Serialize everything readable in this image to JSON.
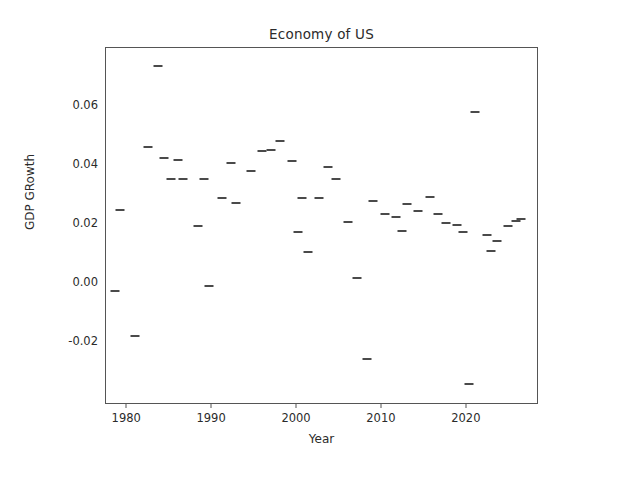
{
  "chart_data": {
    "type": "scatter",
    "title": "Economy of US",
    "xlabel": "Year",
    "ylabel": "GDP GRowth",
    "grid": false,
    "legend": null,
    "marker_style": "horizontal-dash",
    "marker_color": "#4a4a4a",
    "xlim": [
      1977.5,
      2028.5
    ],
    "ylim": [
      -0.0415,
      0.0795
    ],
    "xticks": [
      1980,
      1990,
      2000,
      2010,
      2020
    ],
    "xtick_labels": [
      "1980",
      "1990",
      "2000",
      "2010",
      "2020"
    ],
    "yticks": [
      0.06,
      0.04,
      0.02,
      0.0,
      -0.02
    ],
    "ytick_labels": [
      "0.06",
      "0.04",
      "0.02",
      "0.00",
      "-0.02"
    ],
    "x": [
      1979,
      1980,
      1981,
      1982,
      1983,
      1984,
      1985,
      1986,
      1987,
      1988,
      1989,
      1990,
      1991,
      1992,
      1993,
      1994,
      1995,
      1996,
      1997,
      1998,
      1999,
      2000,
      2001,
      2002,
      2003,
      2004,
      2005,
      2006,
      2007,
      2008,
      2009,
      2010,
      2011,
      2012,
      2013,
      2014,
      2015,
      2016,
      2017,
      2018,
      2019,
      2020,
      2021,
      2022,
      2023,
      2024,
      2025,
      2026
    ],
    "values": [
      0.0245,
      -0.003,
      -0.018,
      0.0733,
      0.0459,
      0.0421,
      0.0417,
      0.0352,
      0.0351,
      0.0192,
      -0.001,
      0.0352,
      0.0285,
      0.0405,
      0.0269,
      0.0379,
      0.0446,
      0.0448,
      0.0481,
      0.0412,
      0.0285,
      0.0173,
      0.0102,
      0.0285,
      0.039,
      0.0352,
      0.0206,
      0.0015,
      -0.0259,
      0.0276,
      0.0234,
      0.0223,
      0.0267,
      0.0175,
      0.0244,
      0.0291,
      0.0234,
      0.0578,
      -0.0345,
      0.0162,
      0.0108,
      0.0141,
      0.0192,
      0.0209,
      0.0201,
      0.0194,
      0.0173,
      0.0215
    ],
    "points": [
      {
        "year": 1979.2,
        "value": 0.0245
      },
      {
        "year": 1978.6,
        "value": -0.003
      },
      {
        "year": 1980.9,
        "value": -0.018
      },
      {
        "year": 1983.6,
        "value": 0.0733
      },
      {
        "year": 1982.4,
        "value": 0.0459
      },
      {
        "year": 1984.3,
        "value": 0.0421
      },
      {
        "year": 1986.0,
        "value": 0.0417
      },
      {
        "year": 1985.1,
        "value": 0.0352
      },
      {
        "year": 1986.6,
        "value": 0.0351
      },
      {
        "year": 1988.3,
        "value": 0.0192
      },
      {
        "year": 1989.6,
        "value": -0.001
      },
      {
        "year": 1989.1,
        "value": 0.0352
      },
      {
        "year": 1991.2,
        "value": 0.0285
      },
      {
        "year": 1992.2,
        "value": 0.0405
      },
      {
        "year": 1992.8,
        "value": 0.0269
      },
      {
        "year": 1994.6,
        "value": 0.0379
      },
      {
        "year": 1995.9,
        "value": 0.0446
      },
      {
        "year": 1996.9,
        "value": 0.0448
      },
      {
        "year": 1998.0,
        "value": 0.0481
      },
      {
        "year": 1999.4,
        "value": 0.0412
      },
      {
        "year": 2000.6,
        "value": 0.0285
      },
      {
        "year": 2000.1,
        "value": 0.0173
      },
      {
        "year": 2001.3,
        "value": 0.0102
      },
      {
        "year": 2002.6,
        "value": 0.0285
      },
      {
        "year": 2003.6,
        "value": 0.039
      },
      {
        "year": 2004.6,
        "value": 0.0352
      },
      {
        "year": 2006.0,
        "value": 0.0206
      },
      {
        "year": 2007.1,
        "value": 0.0015
      },
      {
        "year": 2008.3,
        "value": -0.0259
      },
      {
        "year": 2008.9,
        "value": 0.0276
      },
      {
        "year": 2010.4,
        "value": 0.0234
      },
      {
        "year": 2011.6,
        "value": 0.0223
      },
      {
        "year": 2013.0,
        "value": 0.0267
      },
      {
        "year": 2012.4,
        "value": 0.0175
      },
      {
        "year": 2014.2,
        "value": 0.0244
      },
      {
        "year": 2015.7,
        "value": 0.0291
      },
      {
        "year": 2016.6,
        "value": 0.0234
      },
      {
        "year": 2021.0,
        "value": 0.0578
      },
      {
        "year": 2020.2,
        "value": -0.0345
      },
      {
        "year": 2022.4,
        "value": 0.0162
      },
      {
        "year": 2022.9,
        "value": 0.0108
      },
      {
        "year": 2023.6,
        "value": 0.0141
      },
      {
        "year": 2024.9,
        "value": 0.0192
      },
      {
        "year": 2025.8,
        "value": 0.0209
      },
      {
        "year": 2017.6,
        "value": 0.0201
      },
      {
        "year": 2018.9,
        "value": 0.0194
      },
      {
        "year": 2019.5,
        "value": 0.0173
      },
      {
        "year": 2026.4,
        "value": 0.0215
      }
    ]
  }
}
